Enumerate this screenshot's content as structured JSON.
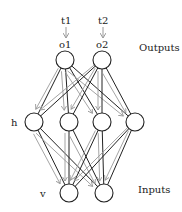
{
  "diagram": {
    "type": "neural-network",
    "targets": [
      {
        "label": "t1",
        "x": 66,
        "y": 21
      },
      {
        "label": "t2",
        "x": 103,
        "y": 21
      }
    ],
    "layers": {
      "output": {
        "side_label": "Outputs",
        "nodes": [
          {
            "label": "o1",
            "x": 65,
            "y": 60
          },
          {
            "label": "o2",
            "x": 102,
            "y": 60
          }
        ]
      },
      "hidden": {
        "side_label": "h",
        "nodes": [
          {
            "x": 34,
            "y": 122
          },
          {
            "x": 69,
            "y": 122
          },
          {
            "x": 102,
            "y": 122
          },
          {
            "x": 135,
            "y": 122
          }
        ]
      },
      "visible": {
        "side_label": "v",
        "nodes": [
          {
            "x": 69,
            "y": 193
          },
          {
            "x": 104,
            "y": 193
          }
        ]
      }
    },
    "inputs_label": "Inputs",
    "colors": {
      "forward_edge": "#222222",
      "backward_arrow": "#9a9a9a",
      "node_stroke": "#222222",
      "node_fill": "#ffffff"
    },
    "node_radius": 9
  }
}
